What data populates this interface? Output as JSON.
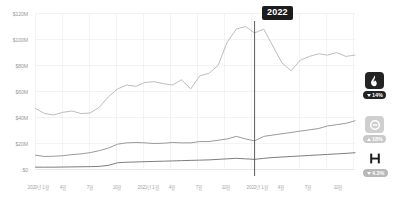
{
  "chart_data": {
    "type": "line",
    "title": "",
    "xlabel": "",
    "ylabel": "",
    "ylim": [
      0,
      120000000
    ],
    "grid": true,
    "legend_position": "right",
    "y_ticks": [
      "$0",
      "$20M",
      "$40M",
      "$60M",
      "$80M",
      "$100M",
      "$120M"
    ],
    "y_tick_values": [
      0,
      20000000,
      40000000,
      60000000,
      80000000,
      100000000,
      120000000
    ],
    "x_ticks": [
      "2020년 1월",
      "4월",
      "7월",
      "10월",
      "2021년 1월",
      "4월",
      "7월",
      "10월",
      "2022년 1월",
      "4월",
      "7월",
      "10월"
    ],
    "annotation": {
      "label": "2022",
      "at_x": "2022년 1월"
    },
    "x": [
      "2020-01",
      "2020-02",
      "2020-03",
      "2020-04",
      "2020-05",
      "2020-06",
      "2020-07",
      "2020-08",
      "2020-09",
      "2020-10",
      "2020-11",
      "2020-12",
      "2021-01",
      "2021-02",
      "2021-03",
      "2021-04",
      "2021-05",
      "2021-06",
      "2021-07",
      "2021-08",
      "2021-09",
      "2021-10",
      "2021-11",
      "2021-12",
      "2022-01",
      "2022-02",
      "2022-03",
      "2022-04",
      "2022-05",
      "2022-06",
      "2022-07",
      "2022-08",
      "2022-09",
      "2022-10",
      "2022-11",
      "2022-12"
    ],
    "series": [
      {
        "name": "flame",
        "color": "#b5b5b5",
        "change_pct": "14%",
        "change_dir": "down",
        "values": [
          47000000,
          43000000,
          42000000,
          44000000,
          45000000,
          43000000,
          43500000,
          48000000,
          56000000,
          62000000,
          65000000,
          64000000,
          67000000,
          67500000,
          66000000,
          65000000,
          69000000,
          62000000,
          72000000,
          74000000,
          80000000,
          98000000,
          108000000,
          110000000,
          105000000,
          108000000,
          95000000,
          82000000,
          76000000,
          84000000,
          87000000,
          89000000,
          88000000,
          90000000,
          87000000,
          88000000
        ]
      },
      {
        "name": "circle",
        "color": "#8f8f8f",
        "change_pct": "18%",
        "change_dir": "up",
        "values": [
          11000000,
          10000000,
          10200000,
          10600000,
          11500000,
          12000000,
          13000000,
          14500000,
          16500000,
          19500000,
          20500000,
          20800000,
          20500000,
          20000000,
          20200000,
          20800000,
          20500000,
          20500000,
          21500000,
          21500000,
          22500000,
          23500000,
          25500000,
          23500000,
          22000000,
          25500000,
          26500000,
          27500000,
          28500000,
          29500000,
          30500000,
          31500000,
          33500000,
          34500000,
          35500000,
          37500000
        ]
      },
      {
        "name": "h-letter",
        "color": "#6e6e6e",
        "change_pct": "4.3%",
        "change_dir": "down",
        "values": [
          1800000,
          1800000,
          1800000,
          1900000,
          2000000,
          2100000,
          2200000,
          2400000,
          3200000,
          5200000,
          5600000,
          5800000,
          6000000,
          6200000,
          6400000,
          6600000,
          6800000,
          7000000,
          7200000,
          7400000,
          7800000,
          8200000,
          8600000,
          8200000,
          7800000,
          8600000,
          9200000,
          9600000,
          10000000,
          10400000,
          10800000,
          11200000,
          11600000,
          12000000,
          12400000,
          12900000
        ]
      }
    ]
  },
  "legend": [
    {
      "icon": "flame-icon",
      "pct": "14%",
      "dir": "down",
      "badge_bg": "#232323",
      "pill_bg": "#232323",
      "icon_color": "#ffffff"
    },
    {
      "icon": "circle-minus-icon",
      "pct": "18%",
      "dir": "up",
      "badge_bg": "#cfcfcf",
      "pill_bg": "#c9c9c9",
      "icon_color": "#ffffff"
    },
    {
      "icon": "letter-h-icon",
      "pct": "4.3%",
      "dir": "down",
      "badge_bg": "#ffffff",
      "pill_bg": "#b8b8b8",
      "icon_color": "#1c1c1c"
    }
  ]
}
